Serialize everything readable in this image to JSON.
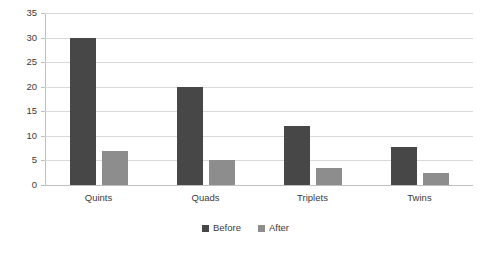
{
  "chart_data": {
    "type": "bar",
    "title": "",
    "subtitle": "",
    "xlabel": "",
    "ylabel": "",
    "categories": [
      "Quints",
      "Quads",
      "Triplets",
      "Twins"
    ],
    "series": [
      {
        "name": "Before",
        "values": [
          30,
          20,
          12,
          7.8
        ],
        "color": "#474747"
      },
      {
        "name": "After",
        "values": [
          7,
          5,
          3.5,
          2.5
        ],
        "color": "#8d8d8d"
      }
    ],
    "ylim": [
      0,
      35
    ],
    "ytick_step": 5,
    "yticks": [
      0,
      5,
      10,
      15,
      20,
      25,
      30,
      35
    ],
    "ytick_labels": [
      "0",
      "5",
      "10",
      "15",
      "20",
      "25",
      "30",
      "35"
    ],
    "grid": true,
    "grid_axis": "y",
    "grid_color": "#d9d9d9",
    "legend": true,
    "legend_position": "bottom",
    "legend_entries": [
      "Before",
      "After"
    ],
    "background": "#ffffff",
    "axis_color": "#bfbfbf",
    "text_color": "#3b3b3b"
  }
}
